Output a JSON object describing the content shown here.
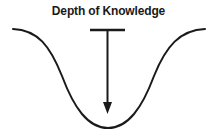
{
  "diagram": {
    "title": "Depth of Knowledge",
    "background_color": "#ffffff",
    "stroke_color": "#1a1a1a",
    "title_color": "#1a1a1a",
    "curve": {
      "name": "knowledge-depth-basin-curve",
      "shape": "symmetric-valley",
      "left_endpoint": [
        13,
        29
      ],
      "right_endpoint": [
        205,
        29
      ],
      "bottom_vertex": [
        108,
        128
      ],
      "stroke_width": 2
    },
    "arrow": {
      "name": "depth-arrow",
      "direction": "down",
      "top_bar_left": [
        90,
        30
      ],
      "top_bar_right": [
        125,
        30
      ],
      "shaft_x": 107.5,
      "shaft_top": 30,
      "tip": [
        107.5,
        114
      ],
      "stroke_width": 2,
      "head_width": 9,
      "head_height": 11
    }
  }
}
